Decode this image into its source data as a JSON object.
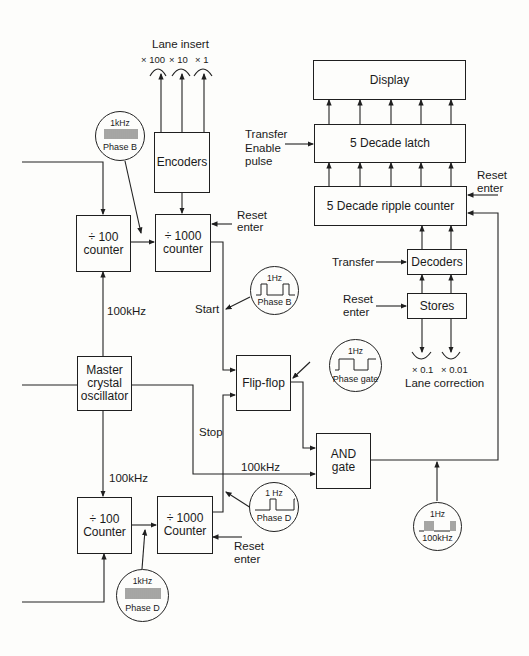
{
  "diagram": {
    "blocks": {
      "display": "Display",
      "latch": "5 Decade latch",
      "ripple_counter": "5 Decade ripple counter",
      "decoders": "Decoders",
      "stores": "Stores",
      "encoders": "Encoders",
      "div100_top": [
        "÷ 100",
        "counter"
      ],
      "div1000_top": [
        "÷ 1000",
        "counter"
      ],
      "master_osc": [
        "Master",
        "crystal",
        "oscillator"
      ],
      "flipflop": "Flip-flop",
      "and_gate": [
        "AND",
        "gate"
      ],
      "div100_bottom": [
        "÷ 100",
        "Counter"
      ],
      "div1000_bottom": [
        "÷ 1000",
        "Counter"
      ]
    },
    "labels": {
      "lane_insert": "Lane insert",
      "lane_insert_dials": [
        "× 100",
        "× 10",
        "× 1"
      ],
      "transfer_enable": [
        "Transfer",
        "Enable",
        "pulse"
      ],
      "reset_enter_ripple": [
        "Reset",
        "enter"
      ],
      "reset_enter_div1000_top": [
        "Reset",
        "enter"
      ],
      "reset_enter_stores": [
        "Reset",
        "enter"
      ],
      "reset_enter_div1000_bottom": [
        "Reset",
        "enter"
      ],
      "transfer": "Transfer",
      "lane_correction": "Lane correction",
      "lane_correction_dials": [
        "× 0.1",
        "× 0.01"
      ],
      "start": "Start",
      "stop": "Stop",
      "freq_100khz_upper": "100kHz",
      "freq_100khz_lower": "100kHz",
      "freq_100khz_and": "100kHz"
    },
    "waveforms": [
      {
        "id": "phase-b-1khz",
        "top": "1kHz",
        "bottom": "Phase B"
      },
      {
        "id": "phase-b-1hz",
        "top": "1Hz",
        "bottom": "Phase B"
      },
      {
        "id": "phase-gate",
        "top": "1Hz",
        "bottom": "Phase gate"
      },
      {
        "id": "phase-d-1hz",
        "top": "1 Hz",
        "bottom": "Phase D"
      },
      {
        "id": "phase-d-1khz",
        "top": "1kHz",
        "bottom": "Phase D"
      },
      {
        "id": "gated-100khz",
        "top": "1Hz",
        "bottom": "100kHz"
      }
    ]
  }
}
